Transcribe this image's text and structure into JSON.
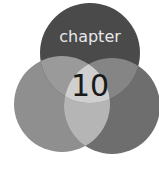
{
  "graphic": {
    "label": "chapter",
    "number": "10",
    "colors": {
      "background": "#ffffff",
      "top_circle": "#4a4a4a",
      "left_circle": "#8f8f8f",
      "right_circle": "#6e6e6e",
      "top_left_overlap": "#9a9a9a",
      "top_right_overlap": "#858585",
      "center": "#cfcfcf",
      "bottom_overlap": "#b5b5b5",
      "label_text": "#e8e8e8",
      "number_text": "#1a1a1a"
    }
  }
}
